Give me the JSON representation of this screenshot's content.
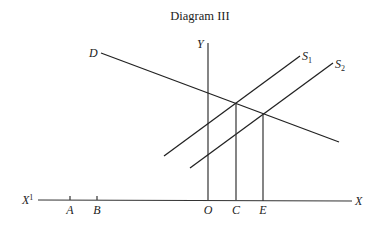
{
  "title": "Diagram III",
  "labels": {
    "y_axis": "Y",
    "x_axis": "X",
    "x_axis_neg": "X",
    "x_axis_neg_sup": "1",
    "demand": "D",
    "supply1": "S",
    "supply1_sub": "1",
    "supply2": "S",
    "supply2_sub": "2",
    "origin": "O",
    "point_a": "A",
    "point_b": "B",
    "point_c": "C",
    "point_e": "E"
  }
}
